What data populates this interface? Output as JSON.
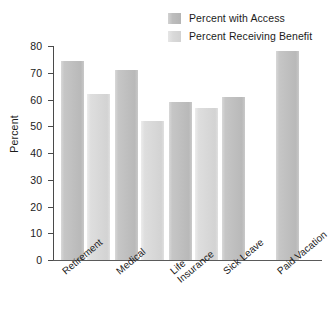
{
  "chart_data": {
    "type": "bar",
    "title": "",
    "xlabel": "",
    "ylabel": "Percent",
    "ylim": [
      0,
      80
    ],
    "yticks": [
      0,
      10,
      20,
      30,
      40,
      50,
      60,
      70,
      80
    ],
    "grid": false,
    "legend_position": "top-right",
    "categories": [
      "Retirement",
      "Medical",
      "Life Insurance",
      "Sick Leave",
      "Paid Vacation"
    ],
    "category_lines": [
      [
        "Retirement"
      ],
      [
        "Medical"
      ],
      [
        "Life",
        "Insurance"
      ],
      [
        "Sick Leave"
      ],
      [
        "Paid Vacation"
      ]
    ],
    "series": [
      {
        "name": "Percent with Access",
        "color": "#bfbfbf",
        "values": [
          74.5,
          71,
          59,
          61,
          78
        ]
      },
      {
        "name": "Percent Receiving Benefit",
        "color": "#d8d8d8",
        "values": [
          62,
          52,
          57,
          null,
          null
        ]
      }
    ]
  },
  "legend": {
    "items": [
      {
        "label": "Percent with Access"
      },
      {
        "label": "Percent Receiving Benefit"
      }
    ]
  },
  "axis": {
    "y_label": "Percent",
    "y_tick_labels": [
      "0",
      "10",
      "20",
      "30",
      "40",
      "50",
      "60",
      "70",
      "80"
    ]
  }
}
